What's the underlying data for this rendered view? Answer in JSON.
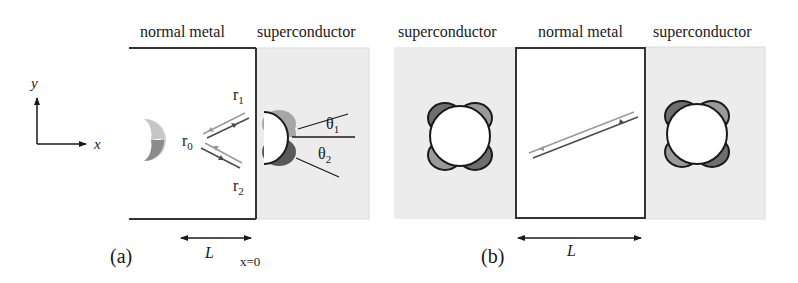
{
  "panel_a": {
    "label": "(a)",
    "regions": {
      "normal_metal": "normal metal",
      "superconductor": "superconductor"
    },
    "axes": {
      "x": "x",
      "y": "y"
    },
    "reflections": {
      "r0": {
        "base": "r",
        "sub": "0"
      },
      "r1": {
        "base": "r",
        "sub": "1"
      },
      "r2": {
        "base": "r",
        "sub": "2"
      }
    },
    "angles": {
      "theta1": {
        "base": "θ",
        "sub": "1"
      },
      "theta2": {
        "base": "θ",
        "sub": "2"
      }
    },
    "length_label": "L",
    "interface_label": "x=0"
  },
  "panel_b": {
    "label": "(b)",
    "regions": {
      "left_superconductor": "superconductor",
      "normal_metal": "normal metal",
      "right_superconductor": "superconductor"
    },
    "length_label": "L"
  },
  "colors": {
    "superconductor_fill": "#ececec",
    "light_lobe": "#bdbdbd",
    "mid_lobe": "#9a9a9a",
    "dark_lobe": "#6e6e6e",
    "line": "#1a1a1a",
    "incoming_ray": "#9a9a9a",
    "outgoing_ray": "#4a4a4a"
  }
}
